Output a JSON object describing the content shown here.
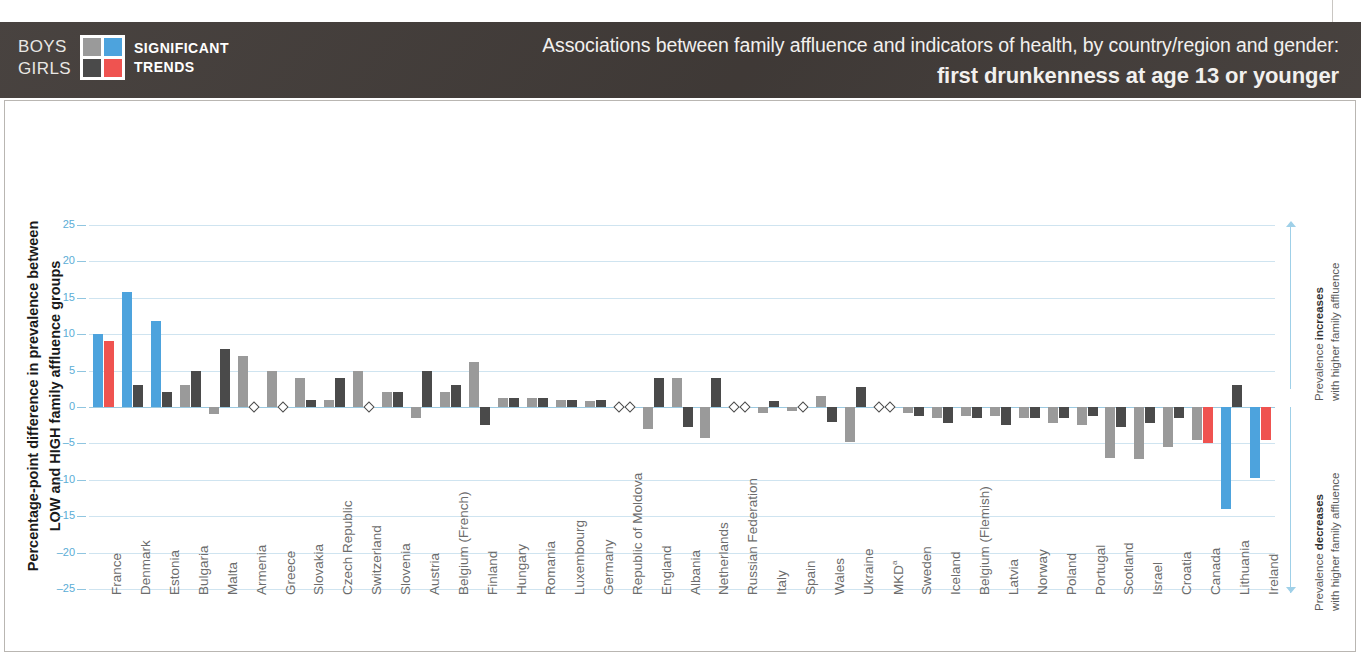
{
  "header": {
    "legend_boys": "BOYS",
    "legend_girls": "GIRLS",
    "legend_significant": "SIGNIFICANT",
    "legend_trends": "TRENDS",
    "title_line1": "Associations between family affluence and indicators of health, by country/region and gender:",
    "title_line2": "first drunkenness at age 13 or younger",
    "colors": {
      "boys_nonsig": "#9a9a9a",
      "boys_sig": "#4da3dd",
      "girls_nonsig": "#4a4a4a",
      "girls_sig": "#ef5350",
      "header_bg": "#423c39",
      "grid": "#cfe4f0",
      "tick_text": "#5badd6"
    }
  },
  "axis": {
    "y_title": "Percentage-point difference in prevalence between LOW and HIGH family affluence groups",
    "y_ticks": [
      25,
      20,
      15,
      10,
      5,
      0,
      "-5",
      "-10",
      "-15",
      "-20",
      "-25"
    ],
    "y_min": -25,
    "y_max": 25
  },
  "annotations": {
    "increase_line1": "Prevalence increases",
    "increase_line2": "with higher family affluence",
    "decrease_line1": "Prevalence decreases",
    "decrease_line2": "with higher family affluence"
  },
  "chart_data": {
    "type": "bar",
    "title": "Associations between family affluence and indicators of health, by country/region and gender: first drunkenness at age 13 or younger",
    "xlabel": "",
    "ylabel": "Percentage-point difference in prevalence between LOW and HIGH family affluence groups",
    "ylim": [
      -25,
      25
    ],
    "grid": true,
    "legend": [
      "BOYS",
      "GIRLS",
      "SIGNIFICANT TRENDS"
    ],
    "categories": [
      "France",
      "Denmark",
      "Estonia",
      "Bulgaria",
      "Malta",
      "Armenia",
      "Greece",
      "Slovakia",
      "Czech Republic",
      "Switzerland",
      "Slovenia",
      "Austria",
      "Belgium (French)",
      "Finland",
      "Hungary",
      "Romania",
      "Luxembourg",
      "Germany",
      "Republic of Moldova",
      "England",
      "Albania",
      "Netherlands",
      "Russian Federation",
      "Italy",
      "Spain",
      "Wales",
      "Ukraine",
      "MKDᵃ",
      "Sweden",
      "Iceland",
      "Belgium (Flemish)",
      "Latvia",
      "Norway",
      "Poland",
      "Portugal",
      "Scotland",
      "Israel",
      "Croatia",
      "Canada",
      "Lithuania",
      "Ireland"
    ],
    "series": [
      {
        "name": "BOYS",
        "values": [
          10.0,
          15.8,
          11.8,
          3.0,
          -1.0,
          7.0,
          5.0,
          4.0,
          1.0,
          5.0,
          2.0,
          -1.5,
          2.0,
          6.2,
          1.2,
          1.2,
          1.0,
          0.8,
          null,
          -3.0,
          4.0,
          -4.2,
          null,
          -0.8,
          -0.6,
          1.5,
          -4.8,
          null,
          -0.8,
          -1.5,
          -1.2,
          -1.2,
          -1.5,
          -2.2,
          -2.5,
          -7.0,
          -7.2,
          -5.5,
          -4.5,
          -14.0,
          -9.8
        ],
        "significant": [
          true,
          true,
          true,
          false,
          false,
          false,
          false,
          false,
          false,
          false,
          false,
          false,
          false,
          false,
          false,
          false,
          false,
          false,
          false,
          false,
          false,
          false,
          false,
          false,
          false,
          false,
          false,
          false,
          false,
          false,
          false,
          false,
          false,
          false,
          false,
          false,
          false,
          false,
          false,
          true,
          true
        ]
      },
      {
        "name": "GIRLS",
        "values": [
          9.0,
          3.0,
          2.0,
          5.0,
          8.0,
          null,
          null,
          1.0,
          4.0,
          null,
          2.0,
          5.0,
          3.0,
          -2.5,
          1.2,
          1.2,
          1.0,
          1.0,
          null,
          4.0,
          -2.8,
          4.0,
          null,
          0.8,
          null,
          -2.0,
          2.8,
          null,
          -1.2,
          -2.2,
          -1.5,
          -2.5,
          -1.5,
          -1.5,
          -1.2,
          -2.8,
          -2.2,
          -1.5,
          -5.0,
          3.0,
          -4.5
        ],
        "significant": [
          true,
          false,
          false,
          false,
          false,
          false,
          false,
          false,
          false,
          false,
          false,
          false,
          false,
          false,
          false,
          false,
          false,
          false,
          false,
          false,
          false,
          false,
          false,
          false,
          false,
          false,
          false,
          false,
          false,
          false,
          false,
          false,
          false,
          false,
          false,
          false,
          false,
          false,
          true,
          false,
          true
        ]
      }
    ],
    "no_data_marker": "diamond",
    "no_data_boys": [
      "Republic of Moldova",
      "Russian Federation",
      "MKDᵃ"
    ],
    "no_data_girls": [
      "Armenia",
      "Greece",
      "Switzerland",
      "Russian Federation",
      "Italy",
      "Spain",
      "MKDᵃ",
      "Belgium (Flemish)",
      "Republic of Moldova"
    ]
  }
}
